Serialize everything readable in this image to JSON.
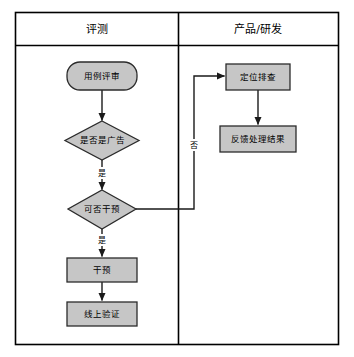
{
  "diagram": {
    "colors": {
      "node_fill": "#c6c6c6",
      "node_stroke": "#2b2b2b",
      "frame_stroke": "#000000",
      "edge_stroke": "#1a1a1a",
      "background": "#ffffff",
      "text": "#000000"
    },
    "lanes": [
      {
        "id": "lane-evaluation",
        "label": "评测"
      },
      {
        "id": "lane-product-rd",
        "label": "产品/研发"
      }
    ],
    "nodes": [
      {
        "id": "node-case-review",
        "label": "用例评审",
        "shape": "rounded-rect",
        "lane": "lane-evaluation"
      },
      {
        "id": "node-is-ad",
        "label": "是否是广告",
        "shape": "diamond",
        "lane": "lane-evaluation"
      },
      {
        "id": "node-can-intervene",
        "label": "可否干预",
        "shape": "diamond",
        "lane": "lane-evaluation"
      },
      {
        "id": "node-intervene",
        "label": "干预",
        "shape": "rect",
        "lane": "lane-evaluation"
      },
      {
        "id": "node-online-verify",
        "label": "线上验证",
        "shape": "rect",
        "lane": "lane-evaluation"
      },
      {
        "id": "node-locate-triage",
        "label": "定位排查",
        "shape": "rect",
        "lane": "lane-product-rd"
      },
      {
        "id": "node-feedback-result",
        "label": "反馈处理结果",
        "shape": "rect",
        "lane": "lane-product-rd"
      }
    ],
    "edges": [
      {
        "id": "edge-review-to-is-ad",
        "from": "node-case-review",
        "to": "node-is-ad",
        "label": ""
      },
      {
        "id": "edge-is-ad-to-can-intervene",
        "from": "node-is-ad",
        "to": "node-can-intervene",
        "label": "是"
      },
      {
        "id": "edge-can-intervene-to-intervene",
        "from": "node-can-intervene",
        "to": "node-intervene",
        "label": "是"
      },
      {
        "id": "edge-intervene-to-verify",
        "from": "node-intervene",
        "to": "node-online-verify",
        "label": ""
      },
      {
        "id": "edge-can-intervene-to-locate",
        "from": "node-can-intervene",
        "to": "node-locate-triage",
        "label": "否"
      },
      {
        "id": "edge-locate-to-feedback",
        "from": "node-locate-triage",
        "to": "node-feedback-result",
        "label": ""
      }
    ]
  }
}
